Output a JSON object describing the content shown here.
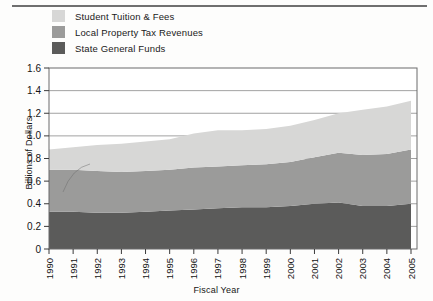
{
  "legend": {
    "items": [
      {
        "label": "Student Tuition & Fees",
        "color": "#d7d7d6",
        "name": "legend-student-tuition"
      },
      {
        "label": "Local Property Tax Revenues",
        "color": "#9b9b9a",
        "name": "legend-local-property-tax"
      },
      {
        "label": "State  General  Funds",
        "color": "#5b5b5a",
        "name": "legend-state-general-funds"
      }
    ]
  },
  "chart_data": {
    "type": "area",
    "stacked": true,
    "title": "",
    "xlabel": "Fiscal Year",
    "ylabel": "Billions of Dollars",
    "ylim": [
      0,
      1.6
    ],
    "yticks": [
      "0",
      "0.2",
      "0.4",
      "0.6",
      "0.8",
      "1.0",
      "1.2",
      "1.4",
      "1.6"
    ],
    "ytick_values": [
      0,
      0.2,
      0.4,
      0.6,
      0.8,
      1.0,
      1.2,
      1.4,
      1.6
    ],
    "grid": "horizontal",
    "legend_position": "above-plot-left",
    "categories": [
      "1990",
      "1991",
      "1992",
      "1993",
      "1994",
      "1995",
      "1996",
      "1997",
      "1998",
      "1999",
      "2000",
      "2001",
      "2002",
      "2003",
      "2004",
      "2005"
    ],
    "series": [
      {
        "name": "State General Funds",
        "color": "#5b5b5a",
        "values": [
          0.33,
          0.33,
          0.32,
          0.32,
          0.33,
          0.34,
          0.35,
          0.36,
          0.37,
          0.37,
          0.38,
          0.4,
          0.41,
          0.38,
          0.38,
          0.4
        ]
      },
      {
        "name": "Local Property Tax Revenues",
        "color": "#9b9b9a",
        "values": [
          0.37,
          0.37,
          0.37,
          0.36,
          0.36,
          0.36,
          0.37,
          0.37,
          0.37,
          0.38,
          0.39,
          0.41,
          0.44,
          0.45,
          0.46,
          0.48
        ]
      },
      {
        "name": "Student Tuition & Fees",
        "color": "#d7d7d6",
        "values": [
          0.18,
          0.2,
          0.23,
          0.25,
          0.26,
          0.27,
          0.3,
          0.32,
          0.31,
          0.31,
          0.32,
          0.33,
          0.35,
          0.4,
          0.42,
          0.43
        ]
      }
    ],
    "cumulative_tops": {
      "state_general_funds": [
        0.33,
        0.33,
        0.32,
        0.32,
        0.33,
        0.34,
        0.35,
        0.36,
        0.37,
        0.37,
        0.38,
        0.4,
        0.41,
        0.38,
        0.38,
        0.4
      ],
      "plus_local_property_tax": [
        0.7,
        0.7,
        0.69,
        0.68,
        0.69,
        0.7,
        0.72,
        0.73,
        0.74,
        0.75,
        0.77,
        0.81,
        0.85,
        0.83,
        0.84,
        0.88
      ],
      "total": [
        0.88,
        0.9,
        0.92,
        0.93,
        0.95,
        0.97,
        1.02,
        1.05,
        1.05,
        1.06,
        1.09,
        1.14,
        1.2,
        1.23,
        1.26,
        1.31
      ]
    }
  }
}
